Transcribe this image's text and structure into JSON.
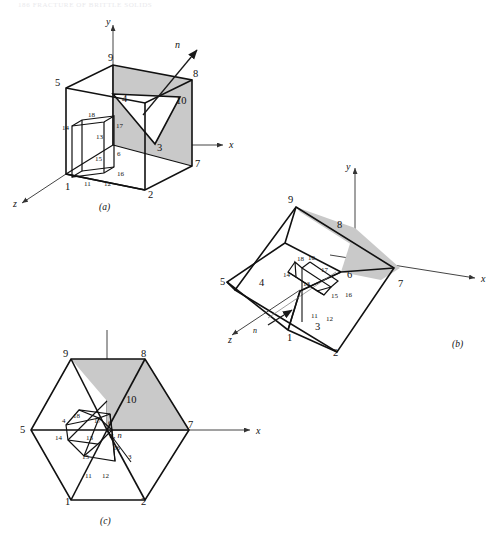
{
  "page": {
    "header_text": "186  FRACTURE OF BRITTLE SOLIDS",
    "background_color": "#ffffff",
    "line_color": "#111111",
    "shade_color": "#c9c9c9",
    "axis_color": "#444444"
  },
  "figures": [
    {
      "id": "a",
      "caption": "(a)",
      "axes": [
        {
          "name": "y-axis-label",
          "label": "y"
        },
        {
          "name": "x-axis-label",
          "label": "x"
        },
        {
          "name": "z-axis-label",
          "label": "z"
        }
      ],
      "normal_label": "n",
      "vertex_labels": [
        {
          "id": "1",
          "text": "1"
        },
        {
          "id": "2",
          "text": "2"
        },
        {
          "id": "3",
          "text": "3"
        },
        {
          "id": "4",
          "text": "4"
        },
        {
          "id": "5",
          "text": "5"
        },
        {
          "id": "6",
          "text": "6"
        },
        {
          "id": "7",
          "text": "7"
        },
        {
          "id": "8",
          "text": "8"
        },
        {
          "id": "9",
          "text": "9"
        },
        {
          "id": "10",
          "text": "10"
        },
        {
          "id": "11",
          "text": "11"
        },
        {
          "id": "12",
          "text": "12"
        },
        {
          "id": "13",
          "text": "13"
        },
        {
          "id": "14",
          "text": "14"
        },
        {
          "id": "15",
          "text": "15"
        },
        {
          "id": "16",
          "text": "16"
        },
        {
          "id": "17",
          "text": "17"
        },
        {
          "id": "18",
          "text": "18"
        }
      ]
    },
    {
      "id": "b",
      "caption": "(b)",
      "axes": [
        {
          "name": "y-axis-label",
          "label": "y"
        },
        {
          "name": "x-axis-label",
          "label": "x"
        },
        {
          "name": "z-axis-label",
          "label": "z"
        }
      ],
      "normal_label": "n",
      "vertex_labels": [
        {
          "id": "1",
          "text": "1"
        },
        {
          "id": "2",
          "text": "2"
        },
        {
          "id": "3",
          "text": "3"
        },
        {
          "id": "4",
          "text": "4"
        },
        {
          "id": "5",
          "text": "5"
        },
        {
          "id": "6",
          "text": "6"
        },
        {
          "id": "7",
          "text": "7"
        },
        {
          "id": "8",
          "text": "8"
        },
        {
          "id": "9",
          "text": "9"
        },
        {
          "id": "10",
          "text": "10"
        },
        {
          "id": "11",
          "text": "11"
        },
        {
          "id": "12",
          "text": "12"
        },
        {
          "id": "13",
          "text": "13"
        },
        {
          "id": "14",
          "text": "14"
        },
        {
          "id": "15",
          "text": "15"
        },
        {
          "id": "16",
          "text": "16"
        },
        {
          "id": "17",
          "text": "17"
        },
        {
          "id": "18",
          "text": "18"
        }
      ]
    },
    {
      "id": "c",
      "caption": "(c)",
      "axes": [
        {
          "name": "y-axis-label",
          "label": "y"
        },
        {
          "name": "x-axis-label",
          "label": "x"
        },
        {
          "name": "zn-axis-label",
          "label": "z, n"
        }
      ],
      "vertex_labels": [
        {
          "id": "1",
          "text": "1"
        },
        {
          "id": "2",
          "text": "2"
        },
        {
          "id": "3",
          "text": "3"
        },
        {
          "id": "4",
          "text": "4"
        },
        {
          "id": "5",
          "text": "5"
        },
        {
          "id": "6",
          "text": "6"
        },
        {
          "id": "7",
          "text": "7"
        },
        {
          "id": "8",
          "text": "8"
        },
        {
          "id": "9",
          "text": "9"
        },
        {
          "id": "10",
          "text": "10"
        },
        {
          "id": "11",
          "text": "11"
        },
        {
          "id": "12",
          "text": "12"
        },
        {
          "id": "13",
          "text": "13"
        },
        {
          "id": "14",
          "text": "14"
        },
        {
          "id": "15",
          "text": "15"
        },
        {
          "id": "16",
          "text": "16"
        },
        {
          "id": "17",
          "text": "17"
        },
        {
          "id": "18",
          "text": "18"
        }
      ]
    }
  ]
}
